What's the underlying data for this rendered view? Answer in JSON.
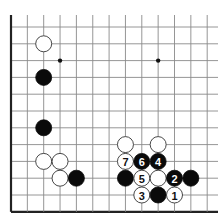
{
  "board": {
    "origin_x": 11,
    "origin_y": 27,
    "spacing_x": 16.35,
    "spacing_y": 16.8,
    "cols": 13,
    "rows": 12,
    "grid_top": 15,
    "grid_right": 218,
    "left_edge": true,
    "bottom_edge": true,
    "stone_radius": 8,
    "star_points": [
      {
        "col": 3,
        "row": 2
      },
      {
        "col": 9,
        "row": 2
      }
    ]
  },
  "stones": [
    {
      "color": "white",
      "col": 2,
      "row": 1,
      "label": ""
    },
    {
      "color": "black",
      "col": 2,
      "row": 3,
      "label": ""
    },
    {
      "color": "black",
      "col": 2,
      "row": 6,
      "label": ""
    },
    {
      "color": "white",
      "col": 2,
      "row": 8,
      "label": ""
    },
    {
      "color": "white",
      "col": 3,
      "row": 8,
      "label": ""
    },
    {
      "color": "white",
      "col": 3,
      "row": 9,
      "label": ""
    },
    {
      "color": "black",
      "col": 4,
      "row": 9,
      "label": ""
    },
    {
      "color": "white",
      "col": 7,
      "row": 7,
      "label": ""
    },
    {
      "color": "white",
      "col": 9,
      "row": 7,
      "label": ""
    },
    {
      "color": "white",
      "col": 7,
      "row": 8,
      "label": "7"
    },
    {
      "color": "black",
      "col": 8,
      "row": 8,
      "label": "6"
    },
    {
      "color": "black",
      "col": 9,
      "row": 8,
      "label": "4"
    },
    {
      "color": "black",
      "col": 7,
      "row": 9,
      "label": ""
    },
    {
      "color": "white",
      "col": 8,
      "row": 9,
      "label": "5"
    },
    {
      "color": "white",
      "col": 9,
      "row": 9,
      "label": ""
    },
    {
      "color": "black",
      "col": 10,
      "row": 9,
      "label": "2"
    },
    {
      "color": "black",
      "col": 11,
      "row": 9,
      "label": ""
    },
    {
      "color": "white",
      "col": 8,
      "row": 10,
      "label": "3"
    },
    {
      "color": "black",
      "col": 9,
      "row": 10,
      "label": ""
    },
    {
      "color": "white",
      "col": 10,
      "row": 10,
      "label": "1"
    }
  ],
  "colors": {
    "background": "#ffffff",
    "grid": "#8a8a8a",
    "edge": "#222222",
    "black_stone": "#0a0a0a",
    "white_stone": "#ffffff"
  }
}
